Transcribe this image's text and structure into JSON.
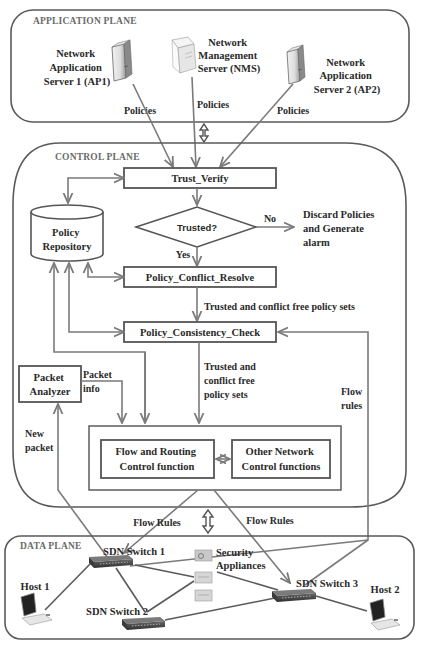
{
  "planes": {
    "application": "APPLICATION PLANE",
    "control": "CONTROL PLANE",
    "data": "DATA PLANE"
  },
  "application_plane": {
    "ap1": {
      "line1": "Network",
      "line2": "Application",
      "line3": "Server 1 (AP1)",
      "icon": "server-tower-icon"
    },
    "nms": {
      "line1": "Network",
      "line2": "Management",
      "line3": "Server (NMS)",
      "icon": "server-tower-icon"
    },
    "ap2": {
      "line1": "Network",
      "line2": "Application",
      "line3": "Server 2 (AP2)",
      "icon": "server-tower-icon"
    },
    "policies_label": "Policies"
  },
  "control_plane": {
    "trust_verify": "Trust_Verify",
    "decision": "Trusted?",
    "no_label": "No",
    "yes_label": "Yes",
    "discard": {
      "line1": "Discard Policies",
      "line2": "and Generate",
      "line3": "alarm"
    },
    "policy_repository": {
      "line1": "Policy",
      "line2": "Repository"
    },
    "policy_conflict_resolve": "Policy_Conflict_Resolve",
    "trusted_conflict_free_1": "Trusted and conflict free policy sets",
    "policy_consistency_check": "Policy_Consistency_Check",
    "trusted_conflict_free_2": {
      "line1": "Trusted and",
      "line2": "conflict free",
      "line3": "policy sets"
    },
    "packet_analyzer": {
      "line1": "Packet",
      "line2": "Analyzer"
    },
    "packet_info": {
      "line1": "Packet",
      "line2": "info"
    },
    "new_packet": {
      "line1": "New",
      "line2": "packet"
    },
    "flow_rules_side": {
      "line1": "Flow",
      "line2": "rules"
    },
    "flow_routing": {
      "line1": "Flow and Routing",
      "line2": "Control function"
    },
    "other_functions": {
      "line1": "Other Network",
      "line2": "Control functions"
    }
  },
  "between": {
    "flow_rules_left": "Flow Rules",
    "flow_rules_right": "Flow Rules"
  },
  "data_plane": {
    "switch1": "SDN Switch 1",
    "switch2": "SDN Switch 2",
    "switch3": "SDN Switch 3",
    "security": {
      "line1": "Security",
      "line2": "Appliances"
    },
    "host1": "Host 1",
    "host2": "Host 2"
  },
  "colors": {
    "line": "#7a7a7a",
    "box_stroke": "#555555",
    "text": "#2a2a2a",
    "plane_label": "#6a6a6a"
  }
}
